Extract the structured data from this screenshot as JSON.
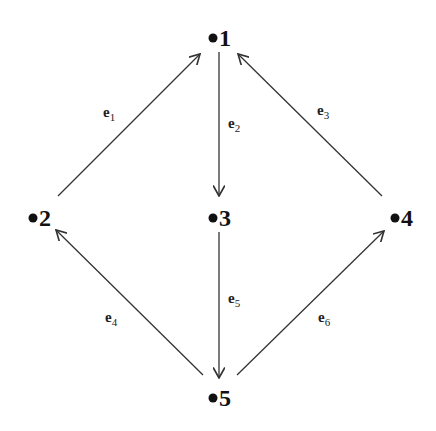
{
  "diagram": {
    "type": "directed-graph",
    "nodes": [
      {
        "id": "1",
        "label": "1",
        "x": 218,
        "y": 38
      },
      {
        "id": "2",
        "label": "2",
        "x": 36,
        "y": 218
      },
      {
        "id": "3",
        "label": "3",
        "x": 218,
        "y": 218
      },
      {
        "id": "4",
        "label": "4",
        "x": 398,
        "y": 218
      },
      {
        "id": "5",
        "label": "5",
        "x": 218,
        "y": 398
      }
    ],
    "edges": [
      {
        "id": "e1",
        "label": "e",
        "sub": "1",
        "from": "2",
        "to": "1"
      },
      {
        "id": "e2",
        "label": "e",
        "sub": "2",
        "from": "1",
        "to": "3"
      },
      {
        "id": "e3",
        "label": "e",
        "sub": "3",
        "from": "4",
        "to": "1"
      },
      {
        "id": "e4",
        "label": "e",
        "sub": "4",
        "from": "5",
        "to": "2"
      },
      {
        "id": "e5",
        "label": "e",
        "sub": "5",
        "from": "3",
        "to": "5"
      },
      {
        "id": "e6",
        "label": "e",
        "sub": "6",
        "from": "5",
        "to": "4"
      }
    ]
  },
  "colors": {
    "ink": "#111111",
    "background": "#ffffff"
  }
}
